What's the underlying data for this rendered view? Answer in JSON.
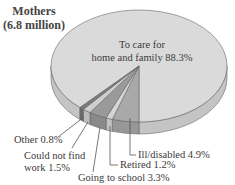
{
  "chart_data": {
    "type": "pie",
    "title": "Mothers",
    "subtitle": "(6.8 million)",
    "three_d": true,
    "units": "%",
    "slices": [
      {
        "label": "To care for home and family",
        "value": 88.3,
        "color": "#dadada",
        "side": "#c4c4c4"
      },
      {
        "label": "Ill/disabled",
        "value": 4.9,
        "color": "#a9a9a9",
        "side": "#979797"
      },
      {
        "label": "Retired",
        "value": 1.2,
        "color": "#d6d6d6",
        "side": "#c2c2c2"
      },
      {
        "label": "Going to school",
        "value": 3.3,
        "color": "#9a9a9a",
        "side": "#8a8a8a"
      },
      {
        "label": "Could not find work",
        "value": 1.5,
        "color": "#cfcfcf",
        "side": "#bbbbbb"
      },
      {
        "label": "Other",
        "value": 0.8,
        "color": "#7a7a7a",
        "side": "#6a6a6a"
      }
    ]
  },
  "header": {
    "title_line1": "Mothers",
    "title_line2": "(6.8 million)"
  },
  "labels": {
    "home_line1": "To care for",
    "home_line2": "home and family 88.3%",
    "ill": "Ill/disabled 4.9%",
    "retired": "Retired 1.2%",
    "school": "Going to school 3.3%",
    "work_line1": "Could not find",
    "work_line2": "work 1.5%",
    "other": "Other 0.8%"
  }
}
